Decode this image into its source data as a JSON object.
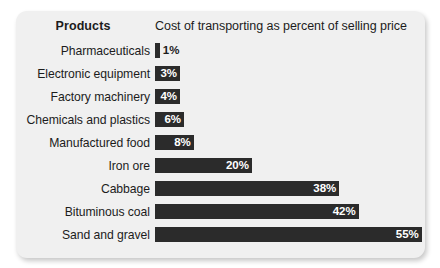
{
  "card": {
    "background": "#f0f0f0",
    "bar_color": "#2b2b2b",
    "text_color": "#1c1c1c"
  },
  "header": {
    "products_label": "Products",
    "measure_label": "Cost of transporting as percent of selling price"
  },
  "chart_data": {
    "type": "bar",
    "orientation": "horizontal",
    "title": "",
    "xlabel": "Cost of transporting as percent of selling price",
    "ylabel": "Products",
    "xlim": [
      0,
      55
    ],
    "grid": false,
    "legend": null,
    "categories": [
      "Pharmaceuticals",
      "Electronic equipment",
      "Factory machinery",
      "Chemicals and plastics",
      "Manufactured food",
      "Iron ore",
      "Cabbage",
      "Bituminous coal",
      "Sand and gravel"
    ],
    "values": [
      1,
      3,
      4,
      6,
      8,
      20,
      38,
      42,
      55
    ],
    "value_labels": [
      "1%",
      "3%",
      "4%",
      "6%",
      "8%",
      "20%",
      "38%",
      "42%",
      "55%"
    ],
    "label_placement": [
      "outside",
      "inside",
      "inside",
      "inside",
      "inside",
      "inside",
      "inside",
      "inside",
      "inside"
    ]
  }
}
